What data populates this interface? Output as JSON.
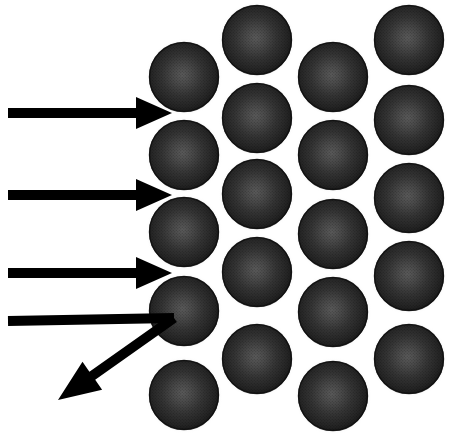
{
  "figure": {
    "title": "Alpha particle scattering by a close-packed lattice of atoms",
    "type": "scientific-diagram",
    "width": 458,
    "height": 437,
    "background_color": "#ffffff"
  },
  "lattice": {
    "name": "sphere-lattice",
    "description": "Hexagonal close-packed array of dark shaded spheres representing atoms",
    "sphere_count": 20,
    "sphere_radius": 35,
    "column_spacing": 75,
    "row_spacing": 78,
    "colors": {
      "sphere_dark": "#1c1c1c",
      "sphere_mid": "#2e2e2e",
      "sphere_highlight": "#555555",
      "sphere_rim": "#0d0d0d",
      "halo": "#d8d8d8"
    },
    "columns": [
      {
        "label": "column-1",
        "cx": 184,
        "spheres": [
          {
            "label": "atom-c1-r1",
            "cy": 77
          },
          {
            "label": "atom-c1-r2",
            "cy": 155
          },
          {
            "label": "atom-c1-r3",
            "cy": 232
          },
          {
            "label": "atom-c1-r4",
            "cy": 311
          },
          {
            "label": "atom-c1-r5",
            "cy": 395
          }
        ]
      },
      {
        "label": "column-2",
        "cx": 257,
        "spheres": [
          {
            "label": "atom-c2-r1",
            "cy": 40
          },
          {
            "label": "atom-c2-r2",
            "cy": 118
          },
          {
            "label": "atom-c2-r3",
            "cy": 194
          },
          {
            "label": "atom-c2-r4",
            "cy": 272
          },
          {
            "label": "atom-c2-r5",
            "cy": 359
          }
        ]
      },
      {
        "label": "column-3",
        "cx": 333,
        "spheres": [
          {
            "label": "atom-c3-r1",
            "cy": 77
          },
          {
            "label": "atom-c3-r2",
            "cy": 155
          },
          {
            "label": "atom-c3-r3",
            "cy": 234
          },
          {
            "label": "atom-c3-r4",
            "cy": 312
          },
          {
            "label": "atom-c3-r5",
            "cy": 396
          }
        ]
      },
      {
        "label": "column-4",
        "cx": 409,
        "spheres": [
          {
            "label": "atom-c4-r1",
            "cy": 40
          },
          {
            "label": "atom-c4-r2",
            "cy": 120
          },
          {
            "label": "atom-c4-r3",
            "cy": 198
          },
          {
            "label": "atom-c4-r4",
            "cy": 276
          },
          {
            "label": "atom-c4-r5",
            "cy": 359
          }
        ]
      }
    ]
  },
  "beams": {
    "name": "incident-beam-group",
    "color": "#000000",
    "shaft_thickness": 10,
    "arrows": [
      {
        "label": "incident-ray-1",
        "kind": "straight-arrow",
        "x1": 8,
        "y1": 113,
        "x2": 172,
        "y2": 113,
        "head_length": 36,
        "head_half_width": 16,
        "has_head": true
      },
      {
        "label": "incident-ray-2",
        "kind": "straight-arrow",
        "x1": 8,
        "y1": 195,
        "x2": 172,
        "y2": 195,
        "head_length": 36,
        "head_half_width": 16,
        "has_head": true
      },
      {
        "label": "incident-ray-3",
        "kind": "straight-arrow",
        "x1": 8,
        "y1": 273,
        "x2": 172,
        "y2": 273,
        "head_length": 36,
        "head_half_width": 16,
        "has_head": true
      },
      {
        "label": "incident-ray-4",
        "kind": "straight-no-head",
        "x1": 8,
        "y1": 321,
        "x2": 174,
        "y2": 318,
        "head_length": 0,
        "head_half_width": 0,
        "has_head": false
      }
    ],
    "scattered": {
      "label": "scattered-ray",
      "kind": "deflected-arrow",
      "x1": 174,
      "y1": 318,
      "x2": 58,
      "y2": 400,
      "head_length": 42,
      "head_half_width": 17,
      "has_head": true,
      "description": "Back-scattered particle deflected down and to the left from the struck atom"
    }
  }
}
